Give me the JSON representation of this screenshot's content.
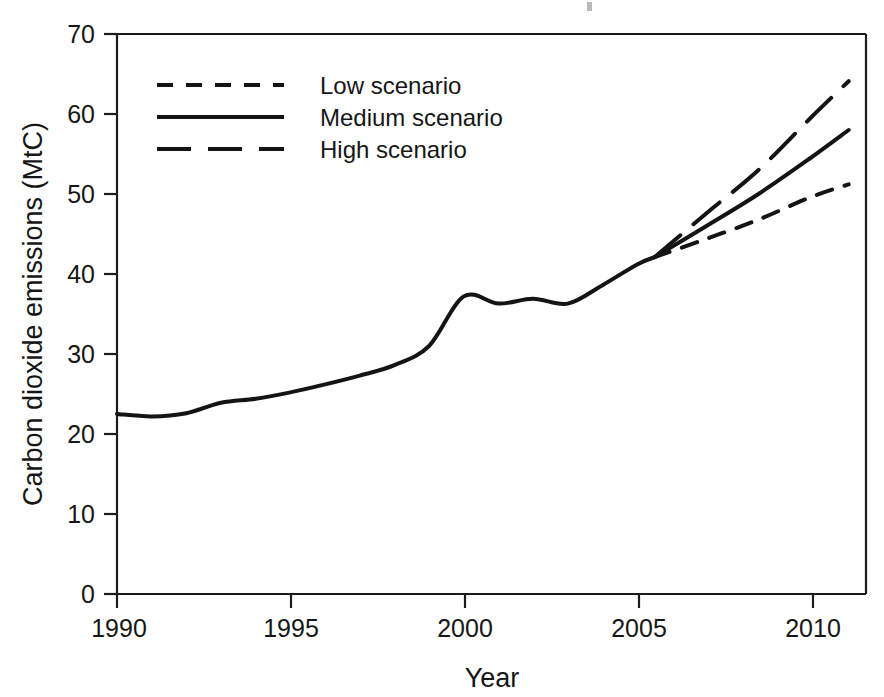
{
  "chart_data": {
    "type": "line",
    "title": "",
    "xlabel": "Year",
    "ylabel": "Carbon dioxide emissions (MtC)",
    "xlim": [
      1990,
      2011.6
    ],
    "ylim": [
      0,
      70
    ],
    "grid": false,
    "legend_position": "top-left inside plot area",
    "x_ticks": [
      1990,
      1995,
      2000,
      2005,
      2010
    ],
    "x_tick_labels": [
      "1990",
      "1995",
      "2000",
      "2005",
      "2010"
    ],
    "y_ticks": [
      0,
      10,
      20,
      30,
      40,
      50,
      60,
      70
    ],
    "y_tick_labels": [
      "0",
      "10",
      "20",
      "30",
      "40",
      "50",
      "60",
      "70"
    ],
    "divergence_year": 2005.5,
    "divergence_value": 42.1,
    "history": {
      "name": "Historical",
      "x": [
        1990,
        1991,
        1992,
        1993,
        1994,
        1995,
        1996,
        1997,
        1998,
        1999,
        2000,
        2001,
        2002,
        2003,
        2004,
        2005,
        2005.5
      ],
      "values": [
        22.5,
        22.2,
        22.6,
        23.9,
        24.4,
        25.2,
        26.2,
        27.3,
        28.6,
        31.0,
        37.2,
        36.3,
        36.9,
        36.3,
        38.6,
        41.2,
        42.1
      ]
    },
    "series": [
      {
        "name": "Low scenario",
        "style": "short-dashed",
        "x": [
          2005.5,
          2007,
          2008.5,
          2010,
          2011.1
        ],
        "values": [
          42.1,
          44.4,
          46.8,
          49.6,
          51.2
        ]
      },
      {
        "name": "Medium scenario",
        "style": "solid",
        "x": [
          2005.5,
          2007,
          2008.5,
          2010,
          2011.1
        ],
        "values": [
          42.1,
          46.0,
          50.0,
          54.5,
          58.0
        ]
      },
      {
        "name": "High scenario",
        "style": "long-dashed",
        "x": [
          2005.5,
          2007,
          2008.5,
          2010,
          2011.1
        ],
        "values": [
          42.1,
          47.6,
          53.0,
          59.5,
          64.1
        ]
      }
    ]
  },
  "axes": {
    "y_title": "Carbon dioxide emissions (MtC)",
    "x_title": "Year",
    "y_labels": {
      "t0": "0",
      "t10": "10",
      "t20": "20",
      "t30": "30",
      "t40": "40",
      "t50": "50",
      "t60": "60",
      "t70": "70"
    },
    "x_labels": {
      "t1990": "1990",
      "t1995": "1995",
      "t2000": "2000",
      "t2005": "2005",
      "t2010": "2010"
    }
  },
  "legend": {
    "entries": [
      {
        "label": "Low scenario",
        "style": "short-dashed"
      },
      {
        "label": "Medium scenario",
        "style": "solid"
      },
      {
        "label": "High scenario",
        "style": "long-dashed"
      }
    ],
    "items": {
      "low": "Low scenario",
      "medium": "Medium scenario",
      "high": "High scenario"
    }
  },
  "colors": {
    "ink": "#141414",
    "background": "#ffffff"
  }
}
